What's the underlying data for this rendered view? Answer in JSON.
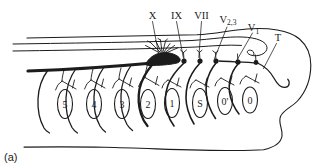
{
  "figure": {
    "caption": "(a)",
    "colors": {
      "background": "#ffffff",
      "ink": "#1c1c1c"
    },
    "nerve_labels": [
      {
        "name": "nerve-X",
        "label": "X",
        "sub": ""
      },
      {
        "name": "nerve-IX",
        "label": "IX",
        "sub": ""
      },
      {
        "name": "nerve-VII",
        "label": "VII",
        "sub": ""
      },
      {
        "name": "nerve-V23",
        "label": "V",
        "sub": "2,3"
      },
      {
        "name": "nerve-V1",
        "label": "V",
        "sub": "1"
      },
      {
        "name": "nerve-T",
        "label": "T",
        "sub": ""
      }
    ],
    "arch_labels": [
      "5",
      "4",
      "3",
      "2",
      "1",
      "S",
      "0'",
      "0"
    ]
  }
}
